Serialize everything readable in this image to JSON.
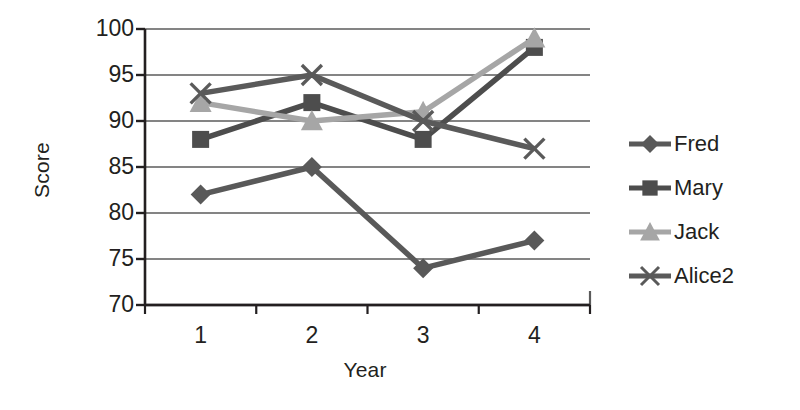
{
  "chart_data": {
    "type": "line",
    "title": "",
    "xlabel": "Year",
    "ylabel": "Score",
    "categories": [
      "1",
      "2",
      "3",
      "4"
    ],
    "x": [
      1,
      2,
      3,
      4
    ],
    "ylim": [
      70,
      100
    ],
    "ytick_values": [
      100,
      95,
      90,
      85,
      80,
      75,
      70
    ],
    "ytick_labels": [
      "100",
      "95",
      "90",
      "85",
      "80",
      "75",
      "70"
    ],
    "grid": true,
    "legend_position": "right",
    "series": [
      {
        "name": "Fred",
        "marker": "diamond",
        "color": "#595959",
        "values": [
          82,
          85,
          74,
          77
        ]
      },
      {
        "name": "Mary",
        "marker": "square",
        "color": "#4d4d4d",
        "values": [
          88,
          92,
          88,
          98
        ]
      },
      {
        "name": "Jack",
        "marker": "triangle",
        "color": "#a6a6a6",
        "values": [
          92,
          90,
          91,
          99
        ]
      },
      {
        "name": "Alice2",
        "marker": "cross",
        "color": "#5a5a5a",
        "values": [
          93,
          95,
          90,
          87
        ]
      }
    ]
  },
  "axes": {
    "y_title": "Score",
    "x_title": "Year"
  },
  "legend": {
    "items": [
      {
        "label": "Fred"
      },
      {
        "label": "Mary"
      },
      {
        "label": "Jack"
      },
      {
        "label": "Alice2"
      }
    ]
  },
  "colors": {
    "axis": "#231f20",
    "grid": "#5b5b5b",
    "background": "#ffffff"
  }
}
